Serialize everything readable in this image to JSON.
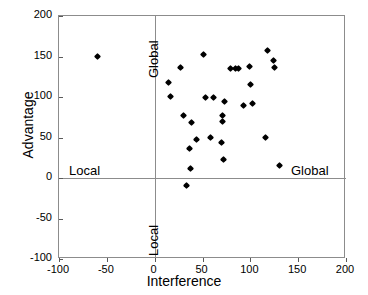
{
  "chart_data": {
    "type": "scatter",
    "title": "",
    "xlabel": "Interference",
    "ylabel": "Advantage",
    "xlim": [
      -100,
      200
    ],
    "ylim": [
      -100,
      200
    ],
    "xticks": [
      "-100",
      "-50",
      "0",
      "50",
      "100",
      "150",
      "200"
    ],
    "xtick_values": [
      -100,
      -50,
      0,
      50,
      100,
      150,
      200
    ],
    "yticks": [
      "200",
      "150",
      "100",
      "50",
      "0",
      "-50",
      "-100"
    ],
    "ytick_values": [
      200,
      150,
      100,
      50,
      0,
      -50,
      -100
    ],
    "grid": false,
    "legend": "none",
    "marker": "diamond",
    "marker_color": "#000000",
    "reference_lines": [
      {
        "axis": "x",
        "value": 0
      },
      {
        "axis": "y",
        "value": 0
      }
    ],
    "annotations": [
      {
        "text": "Global",
        "orientation": "vertical",
        "quadrant": "upper-left-edge"
      },
      {
        "text": "Local",
        "orientation": "vertical",
        "quadrant": "lower-left-edge"
      },
      {
        "text": "Local",
        "orientation": "horizontal",
        "quadrant": "left-of-origin"
      },
      {
        "text": "Global",
        "orientation": "horizontal",
        "quadrant": "right-of-origin"
      }
    ],
    "points": [
      {
        "x": -60,
        "y": 150
      },
      {
        "x": 14,
        "y": 118
      },
      {
        "x": 17,
        "y": 101
      },
      {
        "x": 27,
        "y": 137
      },
      {
        "x": 30,
        "y": 77
      },
      {
        "x": 33,
        "y": -9
      },
      {
        "x": 36,
        "y": 36
      },
      {
        "x": 37,
        "y": 12
      },
      {
        "x": 39,
        "y": 69
      },
      {
        "x": 44,
        "y": 48
      },
      {
        "x": 51,
        "y": 153
      },
      {
        "x": 53,
        "y": 99
      },
      {
        "x": 58,
        "y": 50
      },
      {
        "x": 62,
        "y": 99
      },
      {
        "x": 70,
        "y": 44
      },
      {
        "x": 71,
        "y": 77
      },
      {
        "x": 71,
        "y": 70
      },
      {
        "x": 72,
        "y": 23
      },
      {
        "x": 73,
        "y": 94
      },
      {
        "x": 79,
        "y": 135
      },
      {
        "x": 85,
        "y": 135
      },
      {
        "x": 88,
        "y": 135
      },
      {
        "x": 93,
        "y": 89
      },
      {
        "x": 99,
        "y": 138
      },
      {
        "x": 100,
        "y": 116
      },
      {
        "x": 102,
        "y": 92
      },
      {
        "x": 116,
        "y": 50
      },
      {
        "x": 118,
        "y": 157
      },
      {
        "x": 124,
        "y": 145
      },
      {
        "x": 125,
        "y": 137
      },
      {
        "x": 130,
        "y": 15
      }
    ]
  }
}
